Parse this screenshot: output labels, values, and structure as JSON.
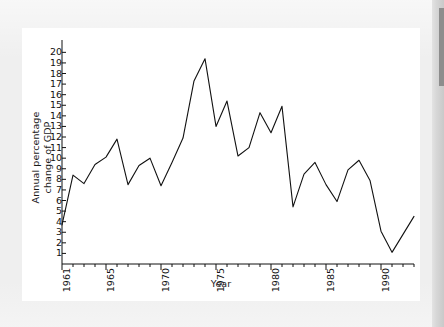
{
  "page": {
    "background_color": "#efefef",
    "card_color": "#ffffff",
    "edge_strip_color": "#8d8d8d"
  },
  "chart_data": {
    "type": "line",
    "title": "",
    "xlabel": "Year",
    "ylabel": "Annual percentage change of GDP",
    "ylabel_lines": [
      "Annual percentage",
      "change of GDP"
    ],
    "xlim": [
      1961,
      1993
    ],
    "ylim": [
      0,
      20.6
    ],
    "grid": false,
    "legend": null,
    "line_color": "#111111",
    "line_width": 1.1,
    "yticks": [
      1,
      2,
      3,
      4,
      5,
      6,
      7,
      8,
      9,
      10,
      11,
      12,
      13,
      14,
      15,
      16,
      17,
      18,
      19,
      20
    ],
    "ytick_labels": [
      "1",
      "2",
      "3",
      "4",
      "5",
      "6",
      "7",
      "8",
      "9",
      "10",
      "11",
      "12",
      "13",
      "14",
      "15",
      "16",
      "17",
      "18",
      "19",
      "20"
    ],
    "xticks_minor": [
      1961,
      1962,
      1963,
      1964,
      1965,
      1966,
      1967,
      1968,
      1969,
      1970,
      1971,
      1972,
      1973,
      1974,
      1975,
      1976,
      1977,
      1978,
      1979,
      1980,
      1981,
      1982,
      1983,
      1984,
      1985,
      1986,
      1987,
      1988,
      1989,
      1990,
      1991,
      1992,
      1993
    ],
    "xticks_labeled": [
      1961,
      1965,
      1970,
      1975,
      1980,
      1985,
      1990
    ],
    "xtick_labels": [
      "1961",
      "1965",
      "1970",
      "1975",
      "1980",
      "1985",
      "1990"
    ],
    "x": [
      1961,
      1962,
      1963,
      1964,
      1965,
      1966,
      1967,
      1968,
      1969,
      1970,
      1971,
      1972,
      1973,
      1974,
      1975,
      1976,
      1977,
      1978,
      1979,
      1980,
      1981,
      1982,
      1983,
      1984,
      1985,
      1986,
      1987,
      1988,
      1989,
      1990,
      1991,
      1992,
      1993
    ],
    "values": [
      3.7,
      8.4,
      7.6,
      9.4,
      10.1,
      11.8,
      7.5,
      9.3,
      10.0,
      7.4,
      9.6,
      11.9,
      17.3,
      19.4,
      13.0,
      15.4,
      10.2,
      11.0,
      14.3,
      12.4,
      14.9,
      5.4,
      8.5,
      9.6,
      7.5,
      5.9,
      8.9,
      9.8,
      7.9,
      3.1,
      1.1,
      2.8,
      4.5
    ],
    "series_name": "Annual percentage change of GDP",
    "peak": {
      "year": 1974,
      "value": 19.4
    },
    "trough": {
      "year": 1991,
      "value": 1.1
    }
  }
}
